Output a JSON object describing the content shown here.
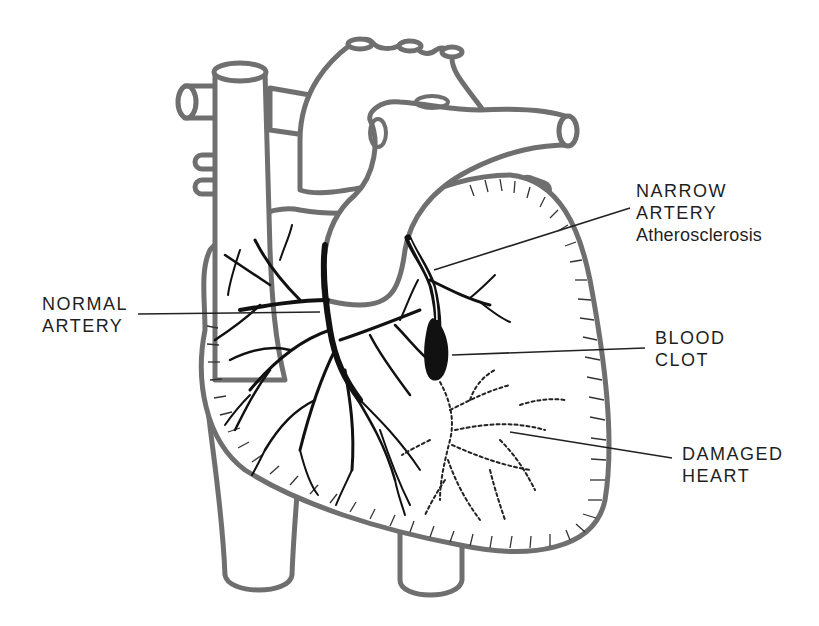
{
  "figure": {
    "colors": {
      "outline": "#6f6f6f",
      "artery": "#111111",
      "text": "#1f1f1f",
      "background": "#ffffff"
    }
  },
  "labels": {
    "normal_artery": {
      "line1": "NORMAL",
      "line2": "ARTERY"
    },
    "narrow_artery": {
      "line1": "NARROW",
      "line2": "ARTERY",
      "line3": "Atherosclerosis"
    },
    "blood_clot": {
      "line1": "BLOOD",
      "line2": "CLOT"
    },
    "damaged_heart": {
      "line1": "DAMAGED",
      "line2": "HEART"
    }
  }
}
